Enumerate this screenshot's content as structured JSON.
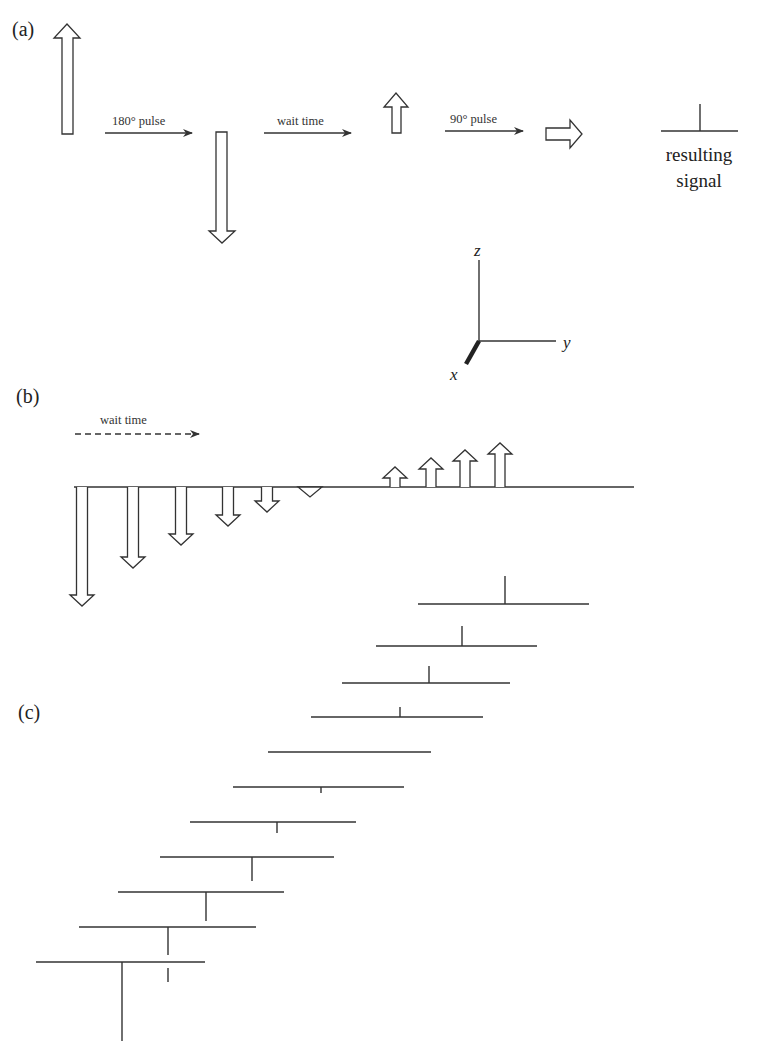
{
  "figure": {
    "panel_a": {
      "label": "(a)",
      "step1_label": "180° pulse",
      "step2_label": "wait time",
      "step3_label": "90° pulse",
      "result_label_line1": "resulting",
      "result_label_line2": "signal",
      "axes": {
        "z": "z",
        "y": "y",
        "x": "x"
      }
    },
    "panel_b": {
      "label": "(b)",
      "wait_label": "wait time",
      "baseline_y": 487,
      "baseline_x": [
        74,
        634
      ],
      "down_arrows": [
        {
          "cx": 82,
          "tip": 606
        },
        {
          "cx": 133,
          "tip": 568
        },
        {
          "cx": 181,
          "tip": 545
        },
        {
          "cx": 228,
          "tip": 526
        },
        {
          "cx": 267,
          "tip": 512
        },
        {
          "cx": 310,
          "tip": 497
        }
      ],
      "up_arrows": [
        {
          "cx": 395,
          "tip": 467
        },
        {
          "cx": 431,
          "tip": 458
        },
        {
          "cx": 465,
          "tip": 450
        },
        {
          "cx": 500,
          "tip": 443
        }
      ]
    },
    "panel_c": {
      "label": "(c)",
      "spectra": [
        {
          "x1": 418,
          "x2": 589,
          "y": 604,
          "sx": 505,
          "h": 28
        },
        {
          "x1": 376,
          "x2": 537,
          "y": 646,
          "sx": 462,
          "h": 20
        },
        {
          "x1": 342,
          "x2": 510,
          "y": 683,
          "sx": 429,
          "h": 17
        },
        {
          "x1": 311,
          "x2": 483,
          "y": 717,
          "sx": 400,
          "h": 10
        },
        {
          "x1": 268,
          "x2": 431,
          "y": 752,
          "sx": 350,
          "h": 0
        },
        {
          "x1": 233,
          "x2": 404,
          "y": 787,
          "sx": 321,
          "h": -6
        },
        {
          "x1": 190,
          "x2": 356,
          "y": 822,
          "sx": 277,
          "h": -11
        },
        {
          "x1": 160,
          "x2": 334,
          "y": 857,
          "sx": 252,
          "h": -24
        },
        {
          "x1": 118,
          "x2": 284,
          "y": 892,
          "sx": 206,
          "h": -29
        },
        {
          "x1": 79,
          "x2": 256,
          "y": 927,
          "sx": 168,
          "h": -28
        },
        {
          "x1": 36,
          "x2": 205,
          "y": 962,
          "sx": 122,
          "h": -79
        }
      ]
    }
  }
}
